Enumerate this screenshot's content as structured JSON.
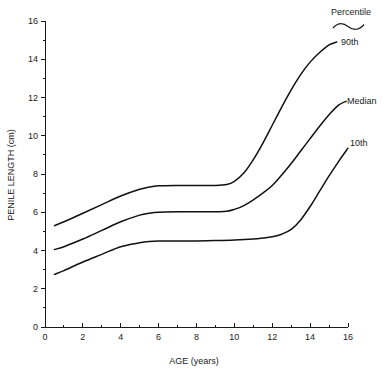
{
  "chart_data": {
    "type": "line",
    "title": "",
    "xlabel": "AGE (years)",
    "ylabel": "PENILE LENGTH (cm)",
    "xlim": [
      0,
      16
    ],
    "ylim": [
      0,
      16
    ],
    "x_ticks": [
      0,
      2,
      4,
      6,
      8,
      10,
      12,
      14,
      16
    ],
    "x_tick_labels": [
      "0",
      "2",
      "4",
      "6",
      "8",
      "10",
      "12",
      "14",
      "16"
    ],
    "x_minor_ticks": [
      1,
      3,
      5,
      7,
      9,
      11,
      13,
      15
    ],
    "y_ticks": [
      0,
      2,
      4,
      6,
      8,
      10,
      12,
      14,
      16
    ],
    "y_tick_labels": [
      "0",
      "2",
      "4",
      "6",
      "8",
      "10",
      "12",
      "14",
      "16"
    ],
    "y_minor_ticks": [
      1,
      3,
      5,
      7,
      9,
      11,
      13,
      15
    ],
    "grid": false,
    "legend_position": "right-inline",
    "legend_title": "Percentile",
    "series": [
      {
        "name": "90th",
        "label": "90th",
        "color": "#111111",
        "x": [
          0.5,
          1,
          2,
          3,
          4,
          5,
          5.5,
          6,
          7,
          8,
          9,
          9.6,
          10,
          10.5,
          11,
          11.5,
          12,
          12.5,
          13,
          13.5,
          14,
          14.5,
          15,
          15.4
        ],
        "y": [
          5.3,
          5.5,
          5.95,
          6.4,
          6.85,
          7.2,
          7.32,
          7.38,
          7.4,
          7.4,
          7.4,
          7.45,
          7.62,
          8.05,
          8.75,
          9.6,
          10.55,
          11.5,
          12.4,
          13.2,
          13.85,
          14.35,
          14.75,
          14.9
        ]
      },
      {
        "name": "Median",
        "label": "Median",
        "color": "#111111",
        "x": [
          0.5,
          1,
          2,
          3,
          4,
          5,
          5.5,
          6,
          7,
          8,
          9,
          9.6,
          10,
          10.5,
          11,
          11.5,
          12,
          12.5,
          13,
          13.5,
          14,
          14.5,
          15,
          15.5,
          15.9
        ],
        "y": [
          4.05,
          4.2,
          4.6,
          5.05,
          5.5,
          5.85,
          5.95,
          6.0,
          6.02,
          6.02,
          6.03,
          6.05,
          6.15,
          6.35,
          6.65,
          7.0,
          7.4,
          7.95,
          8.55,
          9.2,
          9.85,
          10.5,
          11.1,
          11.6,
          11.8
        ]
      },
      {
        "name": "10th",
        "label": "10th",
        "color": "#111111",
        "x": [
          0.5,
          1,
          2,
          3,
          4,
          5,
          5.5,
          6,
          7,
          8,
          9,
          10,
          11,
          11.5,
          12,
          12.5,
          13,
          13.5,
          14,
          14.5,
          15,
          15.5,
          16
        ],
        "y": [
          2.75,
          2.95,
          3.4,
          3.8,
          4.2,
          4.4,
          4.47,
          4.5,
          4.5,
          4.5,
          4.52,
          4.55,
          4.6,
          4.65,
          4.72,
          4.85,
          5.1,
          5.6,
          6.3,
          7.1,
          7.9,
          8.65,
          9.35
        ]
      }
    ]
  },
  "labels": {
    "legend_title": "Percentile",
    "series_90th": "90th",
    "series_median": "Median",
    "series_10th": "10th",
    "x_axis_title": "AGE (years)",
    "y_axis_title": "PENILE LENGTH (cm)"
  },
  "colors": {
    "background": "#ffffff",
    "axis": "#1a1a1a",
    "curve": "#111111",
    "text": "#1a1a1a"
  }
}
